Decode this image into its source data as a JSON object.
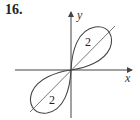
{
  "problem_number": "16.",
  "axes": {
    "x_label": "x",
    "y_label": "y"
  },
  "lobes": [
    {
      "position": "upper-right",
      "label": "2"
    },
    {
      "position": "lower-left",
      "label": "2"
    }
  ],
  "colors": {
    "stroke": "#444444",
    "background": "#ffffff"
  }
}
